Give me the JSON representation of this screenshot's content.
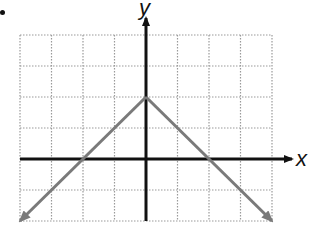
{
  "chart_data": {
    "type": "line",
    "title": "",
    "xlabel": "x",
    "ylabel": "y",
    "grid": true,
    "grid_style": "dotted",
    "xlim": [
      -4,
      4
    ],
    "ylim": [
      -2,
      4
    ],
    "x_range_grid": [
      -4,
      4
    ],
    "y_range_grid": [
      -2,
      4
    ],
    "series": [
      {
        "name": "y = -|x| + 2",
        "x": [
          -4,
          -2,
          0,
          2,
          4
        ],
        "y": [
          -2,
          0,
          2,
          0,
          -2
        ],
        "arrows_at_ends": true,
        "color": "#7a7a7a"
      }
    ],
    "vertex": [
      0,
      2
    ],
    "x_intercepts": [
      -2,
      2
    ],
    "axis_color": "#111111",
    "grid_color": "#9a9a9a"
  },
  "labels": {
    "x_axis": "x",
    "y_axis": "y"
  }
}
